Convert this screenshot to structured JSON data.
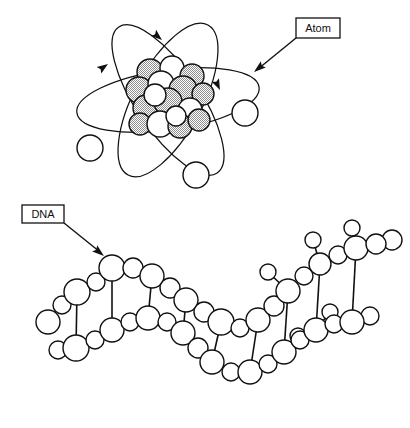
{
  "page": {
    "width": 410,
    "height": 428,
    "background": "#ffffff",
    "ink": "#111111",
    "shading": "#a8a8a8"
  },
  "labels": {
    "atom": {
      "text": "Atom",
      "box": {
        "x": 296,
        "y": 18,
        "w": 44,
        "h": 20
      },
      "leader": {
        "x1": 296,
        "y1": 38,
        "x2": 254,
        "y2": 72
      }
    },
    "dna": {
      "text": "DNA",
      "box": {
        "x": 22,
        "y": 205,
        "w": 42,
        "h": 18
      },
      "leader": {
        "x1": 64,
        "y1": 223,
        "x2": 104,
        "y2": 256
      }
    }
  },
  "atom": {
    "nucleus": {
      "center": {
        "x": 165,
        "y": 97
      },
      "spheres": [
        {
          "x": 150,
          "y": 72,
          "r": 13,
          "shaded": true
        },
        {
          "x": 172,
          "y": 68,
          "r": 12,
          "shaded": false
        },
        {
          "x": 192,
          "y": 76,
          "r": 12,
          "shaded": true
        },
        {
          "x": 139,
          "y": 90,
          "r": 13,
          "shaded": true
        },
        {
          "x": 161,
          "y": 84,
          "r": 13,
          "shaded": false
        },
        {
          "x": 183,
          "y": 90,
          "r": 14,
          "shaded": true
        },
        {
          "x": 203,
          "y": 94,
          "r": 11,
          "shaded": true
        },
        {
          "x": 146,
          "y": 108,
          "r": 13,
          "shaded": true
        },
        {
          "x": 168,
          "y": 102,
          "r": 14,
          "shaded": true
        },
        {
          "x": 190,
          "y": 110,
          "r": 12,
          "shaded": false
        },
        {
          "x": 140,
          "y": 124,
          "r": 11,
          "shaded": true
        },
        {
          "x": 160,
          "y": 124,
          "r": 13,
          "shaded": false
        },
        {
          "x": 180,
          "y": 126,
          "r": 12,
          "shaded": true
        },
        {
          "x": 199,
          "y": 120,
          "r": 11,
          "shaded": true
        },
        {
          "x": 155,
          "y": 95,
          "r": 11,
          "shaded": false
        },
        {
          "x": 176,
          "y": 116,
          "r": 10,
          "shaded": false
        }
      ]
    },
    "electrons": [
      {
        "x": 90,
        "y": 148,
        "r": 13
      },
      {
        "x": 245,
        "y": 113,
        "r": 13
      },
      {
        "x": 196,
        "y": 175,
        "r": 13
      }
    ],
    "orbit_arrows": [
      {
        "at": {
          "x": 160,
          "y": 37
        },
        "angle": 35
      },
      {
        "at": {
          "x": 105,
          "y": 62
        },
        "angle": -42
      },
      {
        "at": {
          "x": 218,
          "y": 87
        },
        "angle": 62
      }
    ]
  },
  "dna": {
    "description": "double helix of outlined spheres with connecting rungs, unwinding to a single strand at upper right",
    "sphere_radius_large": 11,
    "sphere_radius_small": 7,
    "strand_a": [
      {
        "x": 48,
        "y": 322,
        "r": 12
      },
      {
        "x": 62,
        "y": 305,
        "r": 9
      },
      {
        "x": 77,
        "y": 292,
        "r": 13
      },
      {
        "x": 96,
        "y": 282,
        "r": 9
      },
      {
        "x": 112,
        "y": 268,
        "r": 13
      },
      {
        "x": 133,
        "y": 268,
        "r": 10
      },
      {
        "x": 152,
        "y": 276,
        "r": 12
      },
      {
        "x": 170,
        "y": 288,
        "r": 10
      },
      {
        "x": 186,
        "y": 300,
        "r": 12
      },
      {
        "x": 204,
        "y": 312,
        "r": 10
      },
      {
        "x": 221,
        "y": 322,
        "r": 13
      },
      {
        "x": 240,
        "y": 328,
        "r": 9
      },
      {
        "x": 258,
        "y": 320,
        "r": 12
      },
      {
        "x": 274,
        "y": 306,
        "r": 10
      },
      {
        "x": 288,
        "y": 291,
        "r": 12
      },
      {
        "x": 304,
        "y": 276,
        "r": 9
      },
      {
        "x": 320,
        "y": 264,
        "r": 11
      },
      {
        "x": 338,
        "y": 255,
        "r": 9
      },
      {
        "x": 356,
        "y": 248,
        "r": 12
      },
      {
        "x": 376,
        "y": 244,
        "r": 10
      }
    ],
    "strand_b": [
      {
        "x": 58,
        "y": 350,
        "r": 9
      },
      {
        "x": 76,
        "y": 348,
        "r": 13
      },
      {
        "x": 95,
        "y": 340,
        "r": 9
      },
      {
        "x": 112,
        "y": 330,
        "r": 12
      },
      {
        "x": 130,
        "y": 322,
        "r": 9
      },
      {
        "x": 148,
        "y": 318,
        "r": 12
      },
      {
        "x": 167,
        "y": 322,
        "r": 9
      },
      {
        "x": 183,
        "y": 333,
        "r": 12
      },
      {
        "x": 198,
        "y": 348,
        "r": 10
      },
      {
        "x": 212,
        "y": 362,
        "r": 12
      },
      {
        "x": 231,
        "y": 372,
        "r": 9
      },
      {
        "x": 250,
        "y": 372,
        "r": 12
      },
      {
        "x": 268,
        "y": 364,
        "r": 9
      },
      {
        "x": 284,
        "y": 352,
        "r": 12
      },
      {
        "x": 300,
        "y": 340,
        "r": 9
      },
      {
        "x": 316,
        "y": 330,
        "r": 12
      },
      {
        "x": 334,
        "y": 324,
        "r": 9
      },
      {
        "x": 352,
        "y": 322,
        "r": 12
      }
    ],
    "rungs": [
      {
        "x1": 77,
        "y1": 292,
        "x2": 76,
        "y2": 348
      },
      {
        "x1": 112,
        "y1": 268,
        "x2": 112,
        "y2": 330
      },
      {
        "x1": 152,
        "y1": 276,
        "x2": 148,
        "y2": 318
      },
      {
        "x1": 186,
        "y1": 300,
        "x2": 183,
        "y2": 333
      },
      {
        "x1": 221,
        "y1": 322,
        "x2": 212,
        "y2": 362
      },
      {
        "x1": 258,
        "y1": 320,
        "x2": 250,
        "y2": 372
      },
      {
        "x1": 288,
        "y1": 291,
        "x2": 284,
        "y2": 352
      },
      {
        "x1": 320,
        "y1": 264,
        "x2": 316,
        "y2": 330
      },
      {
        "x1": 356,
        "y1": 248,
        "x2": 352,
        "y2": 322
      }
    ],
    "branches": [
      {
        "from": {
          "x": 288,
          "y": 291
        },
        "to": {
          "x": 268,
          "y": 272
        },
        "r": 8
      },
      {
        "from": {
          "x": 320,
          "y": 264
        },
        "to": {
          "x": 313,
          "y": 240
        },
        "r": 8
      },
      {
        "from": {
          "x": 356,
          "y": 248
        },
        "to": {
          "x": 352,
          "y": 228
        },
        "r": 8
      },
      {
        "from": {
          "x": 376,
          "y": 244
        },
        "to": {
          "x": 392,
          "y": 240
        },
        "r": 10
      },
      {
        "from": {
          "x": 284,
          "y": 352
        },
        "to": {
          "x": 298,
          "y": 336
        },
        "r": 8
      },
      {
        "from": {
          "x": 316,
          "y": 330
        },
        "to": {
          "x": 330,
          "y": 312
        },
        "r": 8
      },
      {
        "from": {
          "x": 352,
          "y": 322
        },
        "to": {
          "x": 370,
          "y": 316
        },
        "r": 9
      }
    ]
  }
}
